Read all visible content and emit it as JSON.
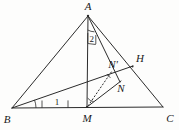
{
  "figure": {
    "kind": "plane-geometry-diagram",
    "background_color": "#fdfdfc",
    "stroke_color": "#2b2b2b",
    "width": 179,
    "height": 130,
    "vertex_labels": {
      "a": "A",
      "b": "B",
      "c": "C",
      "m": "M",
      "h": "H",
      "n": "N",
      "n_prime": "N'"
    },
    "angle_labels": {
      "angle_one": "1",
      "angle_two": "2"
    },
    "points": {
      "A": {
        "x": 88,
        "y": 16
      },
      "B": {
        "x": 12,
        "y": 108
      },
      "C": {
        "x": 163,
        "y": 107
      },
      "M": {
        "x": 87,
        "y": 107
      },
      "H": {
        "x": 132,
        "y": 67
      },
      "N": {
        "x": 118,
        "y": 78
      },
      "Np": {
        "x": 112,
        "y": 70
      }
    },
    "label_positions": {
      "A": {
        "x": 88,
        "y": 10
      },
      "B": {
        "x": 7,
        "y": 121
      },
      "C": {
        "x": 170,
        "y": 120
      },
      "M": {
        "x": 87,
        "y": 121
      },
      "H": {
        "x": 139,
        "y": 62
      },
      "N": {
        "x": 120,
        "y": 90
      },
      "Np": {
        "x": 112,
        "y": 66
      },
      "one": {
        "x": 57,
        "y": 102
      },
      "two": {
        "x": 91,
        "y": 37
      }
    },
    "segments": [
      {
        "name": "side-AB",
        "from": "A",
        "to": "B",
        "style": "solid"
      },
      {
        "name": "side-BC",
        "from": "B",
        "to": "C",
        "style": "solid"
      },
      {
        "name": "side-AC",
        "from": "A",
        "to": "C",
        "style": "solid"
      },
      {
        "name": "median-AM",
        "from": "A",
        "to": "M",
        "style": "solid"
      },
      {
        "name": "cevian-BH",
        "from": "B",
        "to": "H",
        "style": "solid"
      },
      {
        "name": "cevian-AN",
        "from": "A",
        "to": "N",
        "style": "solid"
      },
      {
        "name": "segment-MN",
        "from": "M",
        "to": "N",
        "style": "solid"
      },
      {
        "name": "segment-MNprime",
        "from": "M",
        "to": "Np",
        "style": "dashed"
      }
    ]
  }
}
